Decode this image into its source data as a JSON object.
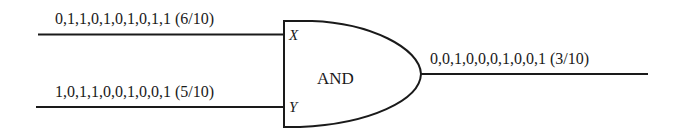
{
  "diagram": {
    "gate": {
      "type": "AND",
      "label": "AND"
    },
    "inputs": [
      {
        "port": "X",
        "bits": "0,1,1,0,1,0,1,0,1,1",
        "probability": "(6/10)",
        "label": "0,1,1,0,1,0,1,0,1,1 (6/10)"
      },
      {
        "port": "Y",
        "bits": "1,0,1,1,0,0,1,0,0,1",
        "probability": "(5/10)",
        "label": "1,0,1,1,0,0,1,0,0,1 (5/10)"
      }
    ],
    "output": {
      "bits": "0,0,1,0,0,0,1,0,0,1",
      "probability": "(3/10)",
      "label": "0,0,1,0,0,0,1,0,0,1 (3/10)"
    },
    "colors": {
      "stroke": "#1a1a1a",
      "background": "#ffffff"
    }
  }
}
